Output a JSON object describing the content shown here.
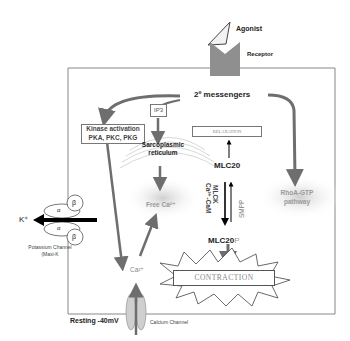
{
  "diagram": {
    "agonist_label": "Agonist",
    "receptor_label": "Receptor",
    "second_messengers_label": "2º messengers",
    "ip3_label": "IP3",
    "kinase_box": {
      "line1": "Kinase activation",
      "line2": "PKA, PKC, PKG"
    },
    "relaxation_label": "RELAXATION",
    "sarcoplasmic_reticulum": {
      "line1": "Sarcoplasmic",
      "line2": "reticulum"
    },
    "mlc20_label": "MLC20",
    "mlck_label": "MLCK",
    "ca_cam_label": "Ca²⁺-CaM",
    "smpp_label": "SMPP",
    "free_ca_label": "Free Ca²⁺",
    "rhoa_label": {
      "line1": "RhoA-GTP",
      "line2": "pathway"
    },
    "mlc20p_label": "MLC20",
    "mlc20p_suffix": "P",
    "contraction_label": "CONTRACTION",
    "ca_label": "Ca²⁺",
    "k_label": "K⁺",
    "alpha": "α",
    "beta": "β",
    "potassium_channel": {
      "line1": "Potassium Channel",
      "line2": "(Maxi-K"
    },
    "resting_label": "Resting -40mV",
    "calcium_channel_label": "Calcium Channel"
  },
  "colors": {
    "arrow_gray": "#6e6e6e",
    "receptor_gray": "#8f8f8f",
    "border_gray": "#888888",
    "black": "#000000"
  }
}
